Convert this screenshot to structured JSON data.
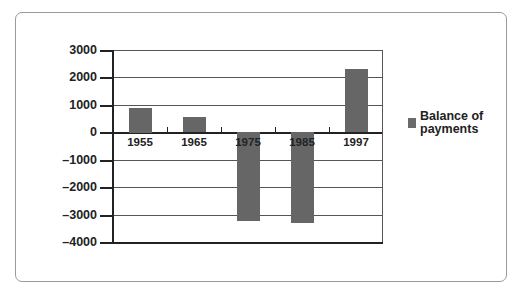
{
  "chart_data": {
    "type": "bar",
    "title": "",
    "xlabel": "",
    "ylabel": "",
    "categories": [
      "1955",
      "1965",
      "1975",
      "1985",
      "1997"
    ],
    "series": [
      {
        "name": "Balance of payments",
        "values": [
          900,
          550,
          -3250,
          -3300,
          2300
        ],
        "color": "#666666"
      }
    ],
    "ylim": [
      -4000,
      3000
    ],
    "yticks": [
      3000,
      2000,
      1000,
      0,
      -1000,
      -2000,
      -3000,
      -4000
    ],
    "ytick_labels": [
      "3000",
      "2000",
      "1000",
      "0",
      "–1000",
      "–2000",
      "–3000",
      "–4000"
    ],
    "grid": true,
    "legend_position": "right"
  },
  "legend": {
    "line1": "Balance of",
    "line2": "payments"
  }
}
